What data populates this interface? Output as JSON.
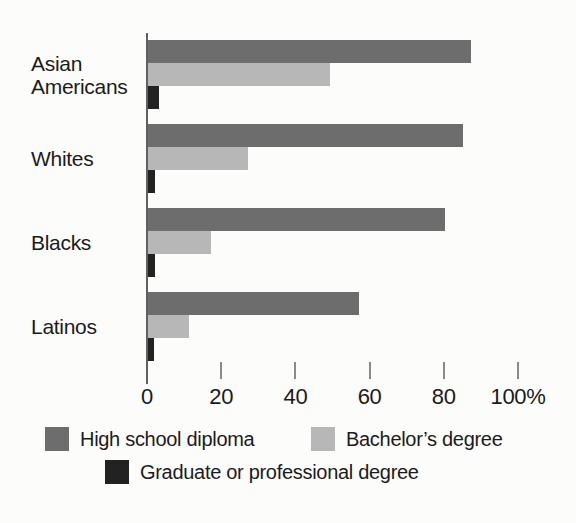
{
  "figure": {
    "background_color": "#fcfcfb",
    "axis_color": "#606060",
    "tick_color": "#8a8a8a",
    "text_color": "#1b1b1b"
  },
  "chart_data": {
    "type": "bar",
    "orientation": "horizontal",
    "title": "",
    "xlabel": "",
    "ylabel": "",
    "categories": [
      "Asian Americans",
      "Whites",
      "Blacks",
      "Latinos"
    ],
    "series": [
      {
        "name": "High school diploma",
        "color": "#6d6d6d",
        "values": [
          87,
          85,
          80,
          57
        ]
      },
      {
        "name": "Bachelor’s degree",
        "color": "#b7b7b7",
        "values": [
          49,
          27,
          17,
          11
        ]
      },
      {
        "name": "Graduate or professional degree",
        "color": "#222222",
        "values": [
          3,
          2,
          2,
          1.5
        ]
      }
    ],
    "unit": "percent",
    "xlim": [
      0,
      100
    ],
    "x_ticks": [
      0,
      20,
      40,
      60,
      80,
      100
    ],
    "x_tick_labels": [
      "0",
      "20",
      "40",
      "60",
      "80",
      "100%"
    ],
    "grid": false,
    "legend_position": "bottom"
  }
}
